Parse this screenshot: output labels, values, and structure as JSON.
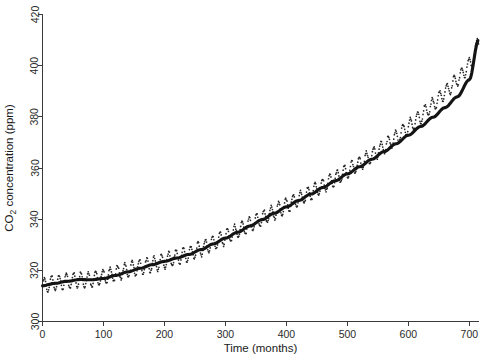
{
  "chart_data": {
    "type": "line",
    "title": "",
    "subtitle": "",
    "xlabel": "Time (months)",
    "ylabel": "CO2 concentration (ppm)",
    "ylabel_parts": {
      "pre": "CO",
      "sub": "2",
      "post": " concentration (ppm)"
    },
    "xlim": [
      0,
      715
    ],
    "ylim": [
      300,
      420
    ],
    "xticks": [
      0,
      100,
      200,
      300,
      400,
      500,
      600,
      700
    ],
    "xtick_labels": [
      "0",
      "100",
      "200",
      "300",
      "400",
      "500",
      "600",
      "700"
    ],
    "yticks": [
      300,
      320,
      340,
      360,
      380,
      400,
      420
    ],
    "ytick_labels": [
      "300",
      "320",
      "340",
      "360",
      "380",
      "400",
      "420"
    ],
    "grid": false,
    "legend": "none",
    "series": [
      {
        "name": "Monthly CO2 observations",
        "style": "dotted-points",
        "color": "#262626",
        "seasonal_amplitude_ppm": 3.0,
        "seasonal_period_months": 12,
        "x": [
          0,
          12,
          24,
          36,
          48,
          60,
          72,
          84,
          96,
          108,
          120,
          132,
          144,
          156,
          168,
          180,
          192,
          204,
          216,
          228,
          240,
          252,
          264,
          276,
          288,
          300,
          312,
          324,
          336,
          348,
          360,
          372,
          384,
          396,
          408,
          420,
          432,
          444,
          456,
          468,
          480,
          492,
          504,
          516,
          528,
          540,
          552,
          564,
          576,
          588,
          600,
          612,
          624,
          636,
          648,
          660,
          672,
          684,
          696,
          708,
          715
        ],
        "values": [
          314.0,
          314.6,
          315.2,
          315.6,
          316.0,
          316.4,
          316.3,
          316.6,
          317.2,
          318.0,
          318.8,
          319.6,
          320.4,
          321.0,
          321.6,
          322.3,
          323.0,
          323.9,
          324.8,
          325.6,
          326.4,
          327.6,
          328.9,
          330.3,
          331.6,
          333.0,
          334.4,
          335.8,
          337.3,
          338.8,
          340.3,
          341.8,
          343.3,
          344.8,
          346.3,
          347.8,
          349.3,
          350.9,
          352.5,
          354.1,
          355.8,
          357.5,
          359.3,
          361.1,
          363.0,
          365.0,
          367.0,
          369.1,
          371.3,
          373.6,
          376.0,
          378.5,
          381.1,
          383.8,
          386.6,
          389.5,
          392.5,
          395.6,
          399.0,
          403.5,
          410.0
        ]
      },
      {
        "name": "Smoothed trend",
        "style": "thick-line",
        "color": "#141414",
        "x": [
          0,
          20,
          40,
          60,
          80,
          100,
          120,
          140,
          160,
          180,
          200,
          220,
          240,
          260,
          280,
          300,
          320,
          340,
          360,
          380,
          400,
          420,
          440,
          460,
          480,
          500,
          520,
          540,
          560,
          580,
          600,
          620,
          640,
          660,
          680,
          700,
          715
        ],
        "values": [
          314.0,
          314.9,
          315.7,
          316.4,
          316.3,
          316.8,
          318.0,
          319.4,
          320.8,
          322.2,
          323.5,
          324.8,
          326.2,
          328.1,
          330.3,
          332.6,
          334.9,
          337.3,
          339.8,
          342.3,
          344.8,
          347.3,
          349.8,
          352.4,
          355.0,
          357.7,
          360.5,
          363.4,
          366.4,
          369.5,
          372.8,
          376.2,
          379.8,
          383.6,
          387.8,
          394.5,
          410.0
        ]
      }
    ]
  },
  "axes": {
    "x_axis_name": "time-axis",
    "y_axis_name": "co2-axis"
  }
}
